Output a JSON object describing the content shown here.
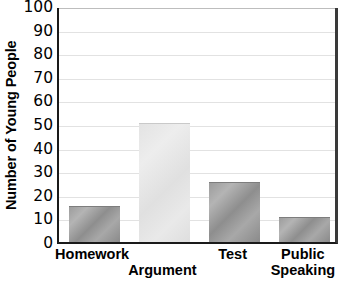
{
  "chart_data": {
    "type": "bar",
    "title": "",
    "xlabel": "",
    "ylabel": "Number of Young People",
    "categories": [
      "Homework",
      "Argument",
      "Test",
      "Public Speaking"
    ],
    "category_lines": [
      [
        "Homework",
        ""
      ],
      [
        "",
        "Argument"
      ],
      [
        "Test",
        ""
      ],
      [
        "Public",
        "Speaking"
      ]
    ],
    "values": [
      15,
      50,
      25,
      10
    ],
    "ylim": [
      0,
      100
    ],
    "ytick_step": 10,
    "yticks": [
      0,
      10,
      20,
      30,
      40,
      50,
      60,
      70,
      80,
      90,
      100
    ],
    "ytick_labels": [
      "0",
      "10",
      "20",
      "30",
      "40",
      "50",
      "60",
      "70",
      "80",
      "90",
      "100"
    ],
    "grid": true,
    "legend": false,
    "bar_colors": [
      "#9c9c9c",
      "#e6e6e6",
      "#9c9c9c",
      "#9c9c9c"
    ],
    "bar_styles": [
      "dark",
      "light",
      "dark",
      "dark"
    ],
    "axis_color": "#1a1a1a",
    "gridline_color": "#e2e2e2",
    "background": "#ffffff"
  },
  "axis": {
    "y_title": "Number of Young People"
  }
}
